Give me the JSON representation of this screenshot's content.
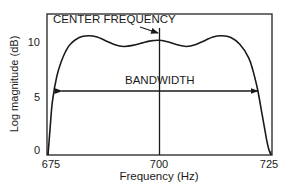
{
  "chart_data": {
    "type": "line",
    "title": "",
    "xlabel": "Frequency (Hz)",
    "ylabel": "Log magnitude (dB)",
    "xlim": [
      675,
      725
    ],
    "ylim": [
      0,
      11.5
    ],
    "x_ticks": [
      675,
      700,
      725
    ],
    "y_ticks": [
      0,
      5,
      10
    ],
    "grid": false,
    "legend": null,
    "series": [
      {
        "name": "Bandpass filter response",
        "x": [
          675,
          675.5,
          676,
          677,
          678,
          679,
          680,
          682,
          684,
          686,
          688,
          690,
          692,
          694,
          696,
          698,
          700,
          702,
          704,
          706,
          708,
          710,
          712,
          714,
          716,
          718,
          720,
          721,
          722,
          723,
          724,
          724.5,
          725
        ],
        "y": [
          0,
          2.5,
          4.8,
          7.0,
          8.3,
          9.2,
          9.8,
          10.4,
          10.55,
          10.45,
          10.1,
          9.75,
          9.6,
          9.7,
          9.9,
          10.1,
          10.15,
          10.0,
          9.75,
          9.6,
          9.75,
          10.1,
          10.45,
          10.55,
          10.4,
          9.8,
          8.6,
          7.4,
          5.8,
          3.6,
          1.4,
          0.5,
          0
        ]
      }
    ],
    "annotations": [
      {
        "text": "CENTER FREQUENCY",
        "target_x": 700,
        "type": "arrow-label"
      },
      {
        "text": "BANDWIDTH",
        "from_x": 678,
        "to_x": 722,
        "y": 6.2,
        "type": "double-arrow"
      },
      {
        "type": "vline",
        "x": 700
      }
    ]
  },
  "labels": {
    "center_frequency": "CENTER FREQUENCY",
    "bandwidth": "BANDWIDTH",
    "xlabel": "Frequency (Hz)",
    "ylabel": "Log magnitude (dB)",
    "x_ticks": [
      "675",
      "700",
      "725"
    ],
    "y_ticks": [
      "0",
      "5",
      "10"
    ]
  },
  "colors": {
    "line": "#1a1a1a",
    "background": "#ffffff"
  }
}
